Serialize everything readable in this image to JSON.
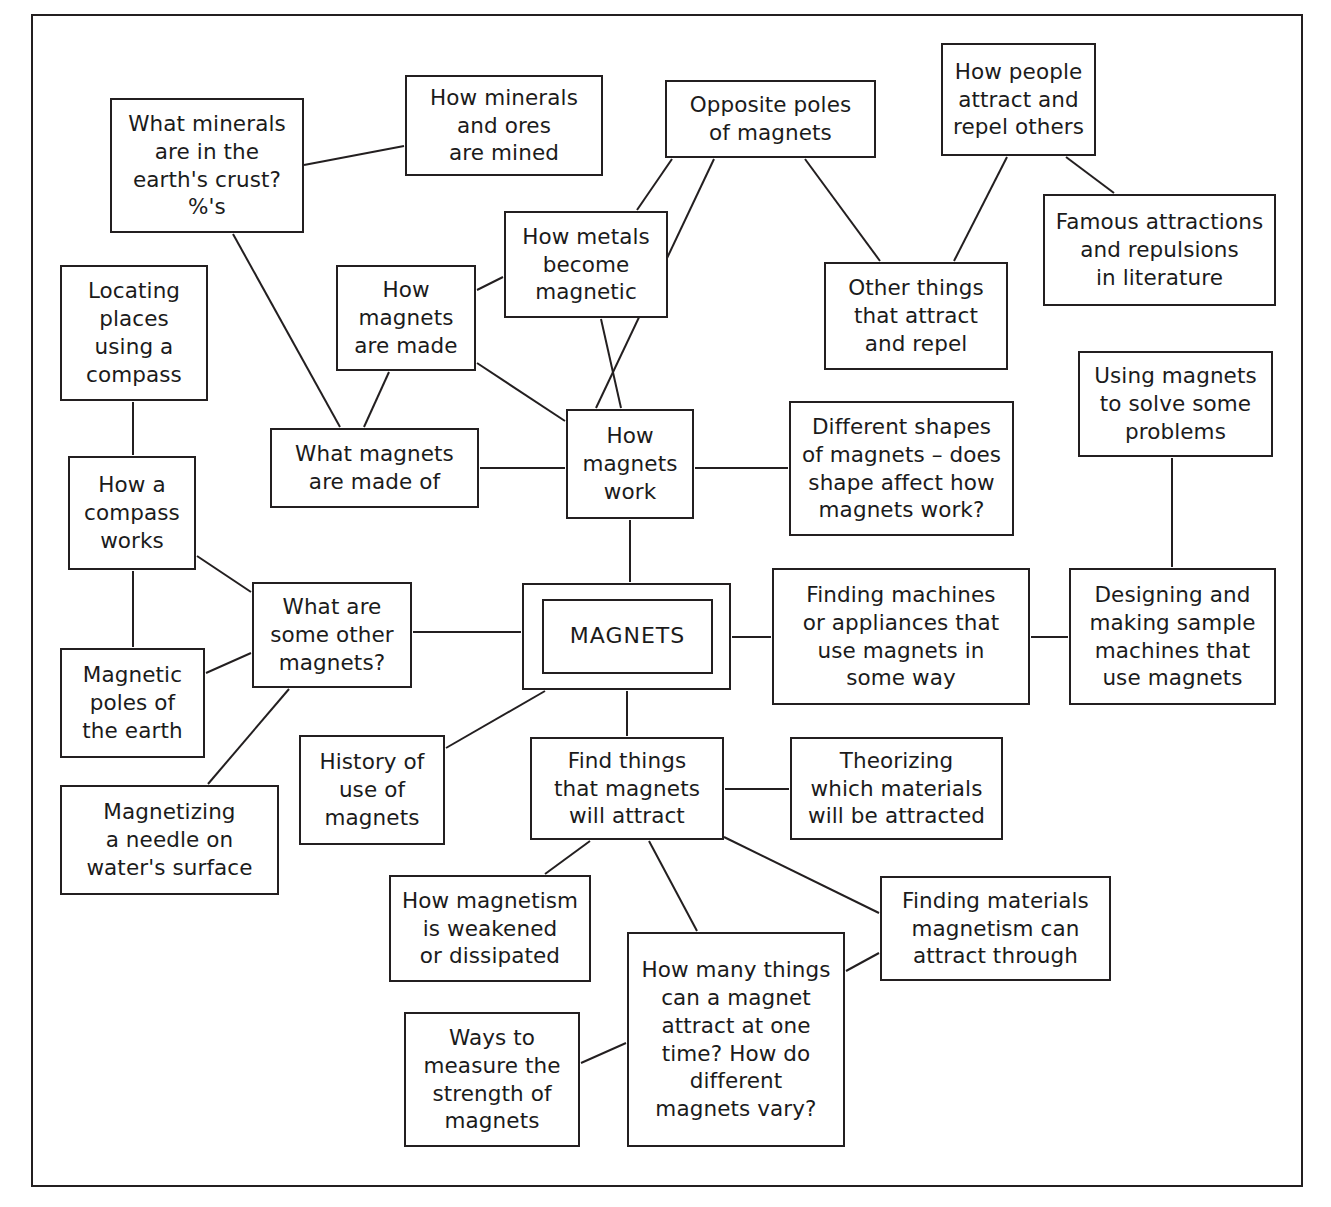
{
  "diagram": {
    "title": "MAGNETS",
    "type": "concept-map",
    "frame": {
      "x": 31,
      "y": 14,
      "width": 1272,
      "height": 1173
    },
    "line_color": "#231f20",
    "background_color": "#ffffff"
  },
  "nodes": [
    {
      "id": "what-minerals",
      "label": "What minerals\nare in the\nearth's crust?\n%'s",
      "x": 110,
      "y": 98,
      "w": 194,
      "h": 135
    },
    {
      "id": "how-minerals-mined",
      "label": "How minerals\nand ores\nare mined",
      "x": 405,
      "y": 75,
      "w": 198,
      "h": 101
    },
    {
      "id": "opposite-poles",
      "label": "Opposite poles\nof magnets",
      "x": 665,
      "y": 80,
      "w": 211,
      "h": 78
    },
    {
      "id": "how-people-attract",
      "label": "How people\nattract and\nrepel others",
      "x": 941,
      "y": 43,
      "w": 155,
      "h": 113
    },
    {
      "id": "famous-attractions",
      "label": "Famous attractions\nand repulsions\nin literature",
      "x": 1043,
      "y": 194,
      "w": 233,
      "h": 112
    },
    {
      "id": "how-metals-magnetic",
      "label": "How metals\nbecome\nmagnetic",
      "x": 504,
      "y": 211,
      "w": 164,
      "h": 107
    },
    {
      "id": "how-magnets-made",
      "label": "How\nmagnets\nare made",
      "x": 336,
      "y": 265,
      "w": 140,
      "h": 106
    },
    {
      "id": "locating-places",
      "label": "Locating\nplaces\nusing a\ncompass",
      "x": 60,
      "y": 265,
      "w": 148,
      "h": 136
    },
    {
      "id": "other-things-attract",
      "label": "Other things\nthat attract\nand repel",
      "x": 824,
      "y": 262,
      "w": 184,
      "h": 108
    },
    {
      "id": "using-magnets-solve",
      "label": "Using magnets\nto solve some\nproblems",
      "x": 1078,
      "y": 351,
      "w": 195,
      "h": 106
    },
    {
      "id": "what-magnets-made-of",
      "label": "What magnets\nare made of",
      "x": 270,
      "y": 428,
      "w": 209,
      "h": 80
    },
    {
      "id": "how-magnets-work",
      "label": "How\nmagnets\nwork",
      "x": 566,
      "y": 409,
      "w": 128,
      "h": 110
    },
    {
      "id": "different-shapes",
      "label": "Different shapes\nof magnets – does\nshape affect how\nmagnets work?",
      "x": 789,
      "y": 401,
      "w": 225,
      "h": 135
    },
    {
      "id": "how-compass-works",
      "label": "How a\ncompass\nworks",
      "x": 68,
      "y": 456,
      "w": 128,
      "h": 114
    },
    {
      "id": "what-other-magnets",
      "label": "What are\nsome other\nmagnets?",
      "x": 252,
      "y": 582,
      "w": 160,
      "h": 106
    },
    {
      "id": "magnets",
      "label": "MAGNETS",
      "x": 522,
      "y": 583,
      "w": 209,
      "h": 107,
      "central": true
    },
    {
      "id": "finding-machines",
      "label": "Finding machines\nor appliances that\nuse magnets in\nsome way",
      "x": 772,
      "y": 568,
      "w": 258,
      "h": 137
    },
    {
      "id": "designing-making",
      "label": "Designing and\nmaking sample\nmachines that\nuse magnets",
      "x": 1069,
      "y": 568,
      "w": 207,
      "h": 137
    },
    {
      "id": "magnetic-poles-earth",
      "label": "Magnetic\npoles of\nthe earth",
      "x": 60,
      "y": 648,
      "w": 145,
      "h": 110
    },
    {
      "id": "history-of-use",
      "label": "History of\nuse of\nmagnets",
      "x": 299,
      "y": 735,
      "w": 146,
      "h": 110
    },
    {
      "id": "find-things-attract",
      "label": "Find things\nthat magnets\nwill attract",
      "x": 530,
      "y": 737,
      "w": 194,
      "h": 103
    },
    {
      "id": "theorizing-materials",
      "label": "Theorizing\nwhich materials\nwill be attracted",
      "x": 790,
      "y": 737,
      "w": 213,
      "h": 103
    },
    {
      "id": "magnetizing-needle",
      "label": "Magnetizing\na needle on\nwater's surface",
      "x": 60,
      "y": 785,
      "w": 219,
      "h": 110
    },
    {
      "id": "how-magnetism-weak",
      "label": "How magnetism\nis weakened\nor dissipated",
      "x": 389,
      "y": 875,
      "w": 202,
      "h": 107
    },
    {
      "id": "finding-materials",
      "label": "Finding materials\nmagnetism can\nattract through",
      "x": 880,
      "y": 876,
      "w": 231,
      "h": 105
    },
    {
      "id": "how-many-things",
      "label": "How many things\ncan a magnet\nattract at one\ntime? How do\ndifferent\nmagnets vary?",
      "x": 627,
      "y": 932,
      "w": 218,
      "h": 215
    },
    {
      "id": "ways-to-measure",
      "label": "Ways to\nmeasure the\nstrength of\nmagnets",
      "x": 404,
      "y": 1012,
      "w": 176,
      "h": 135
    }
  ],
  "edges": [
    {
      "from": "what-minerals",
      "to": "how-minerals-mined",
      "x1": 304,
      "y1": 165,
      "x2": 404,
      "y2": 146
    },
    {
      "from": "what-minerals",
      "to": "what-magnets-made-of",
      "x1": 233,
      "y1": 234,
      "x2": 340,
      "y2": 427
    },
    {
      "from": "opposite-poles",
      "to": "how-metals-magnetic",
      "x1": 672,
      "y1": 159,
      "x2": 637,
      "y2": 210
    },
    {
      "from": "opposite-poles",
      "to": "how-magnets-work",
      "x1": 714,
      "y1": 159,
      "x2": 596,
      "y2": 408
    },
    {
      "from": "opposite-poles",
      "to": "other-things-attract",
      "x1": 805,
      "y1": 159,
      "x2": 880,
      "y2": 261
    },
    {
      "from": "how-people-attract",
      "to": "other-things-attract",
      "x1": 1007,
      "y1": 157,
      "x2": 954,
      "y2": 261
    },
    {
      "from": "how-people-attract",
      "to": "famous-attractions",
      "x1": 1066,
      "y1": 157,
      "x2": 1114,
      "y2": 193
    },
    {
      "from": "how-magnets-made",
      "to": "how-metals-magnetic",
      "x1": 477,
      "y1": 290,
      "x2": 503,
      "y2": 277
    },
    {
      "from": "how-magnets-made",
      "to": "what-magnets-made-of",
      "x1": 389,
      "y1": 372,
      "x2": 364,
      "y2": 427
    },
    {
      "from": "how-magnets-made",
      "to": "how-magnets-work",
      "x1": 477,
      "y1": 363,
      "x2": 565,
      "y2": 421
    },
    {
      "from": "how-metals-magnetic",
      "to": "how-magnets-work",
      "x1": 601,
      "y1": 319,
      "x2": 621,
      "y2": 408
    },
    {
      "from": "locating-places",
      "to": "how-compass-works",
      "x1": 133,
      "y1": 402,
      "x2": 133,
      "y2": 455
    },
    {
      "from": "what-magnets-made-of",
      "to": "how-magnets-work",
      "x1": 480,
      "y1": 468,
      "x2": 565,
      "y2": 468
    },
    {
      "from": "how-magnets-work",
      "to": "different-shapes",
      "x1": 695,
      "y1": 468,
      "x2": 788,
      "y2": 468
    },
    {
      "from": "how-magnets-work",
      "to": "magnets",
      "x1": 630,
      "y1": 520,
      "x2": 630,
      "y2": 582
    },
    {
      "from": "using-magnets-solve",
      "to": "designing-making",
      "x1": 1172,
      "y1": 458,
      "x2": 1172,
      "y2": 567
    },
    {
      "from": "how-compass-works",
      "to": "what-other-magnets",
      "x1": 197,
      "y1": 556,
      "x2": 251,
      "y2": 592
    },
    {
      "from": "how-compass-works",
      "to": "magnetic-poles-earth",
      "x1": 133,
      "y1": 571,
      "x2": 133,
      "y2": 647
    },
    {
      "from": "magnetic-poles-earth",
      "to": "what-other-magnets",
      "x1": 206,
      "y1": 673,
      "x2": 251,
      "y2": 653
    },
    {
      "from": "what-other-magnets",
      "to": "magnets",
      "x1": 413,
      "y1": 632,
      "x2": 521,
      "y2": 632
    },
    {
      "from": "what-other-magnets",
      "to": "magnetizing-needle",
      "x1": 289,
      "y1": 689,
      "x2": 208,
      "y2": 784
    },
    {
      "from": "magnets",
      "to": "finding-machines",
      "x1": 732,
      "y1": 637,
      "x2": 771,
      "y2": 637
    },
    {
      "from": "finding-machines",
      "to": "designing-making",
      "x1": 1031,
      "y1": 637,
      "x2": 1068,
      "y2": 637
    },
    {
      "from": "magnets",
      "to": "history-of-use",
      "x1": 545,
      "y1": 691,
      "x2": 446,
      "y2": 748
    },
    {
      "from": "magnets",
      "to": "find-things-attract",
      "x1": 627,
      "y1": 691,
      "x2": 627,
      "y2": 736
    },
    {
      "from": "find-things-attract",
      "to": "theorizing-materials",
      "x1": 725,
      "y1": 789,
      "x2": 789,
      "y2": 789
    },
    {
      "from": "find-things-attract",
      "to": "how-magnetism-weak",
      "x1": 590,
      "y1": 841,
      "x2": 545,
      "y2": 874
    },
    {
      "from": "find-things-attract",
      "to": "how-many-things",
      "x1": 649,
      "y1": 841,
      "x2": 697,
      "y2": 931
    },
    {
      "from": "find-things-attract",
      "to": "finding-materials",
      "x1": 724,
      "y1": 837,
      "x2": 879,
      "y2": 913
    },
    {
      "from": "how-many-things",
      "to": "finding-materials",
      "x1": 846,
      "y1": 971,
      "x2": 879,
      "y2": 953
    },
    {
      "from": "ways-to-measure",
      "to": "how-many-things",
      "x1": 581,
      "y1": 1063,
      "x2": 626,
      "y2": 1043
    }
  ]
}
